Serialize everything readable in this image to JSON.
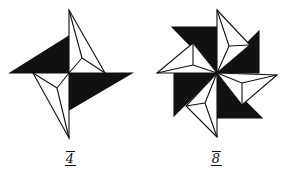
{
  "figures": [
    {
      "id": "fig-4",
      "label": "4",
      "description": "Fourfold pinwheel star: two black triangles and two white kite-shaped points",
      "fill_color": "#111111",
      "stroke_color": "#111111"
    },
    {
      "id": "fig-8",
      "label": "8",
      "description": "Eightfold pinwheel star: four black triangles and four white kite-shaped points",
      "fill_color": "#111111",
      "stroke_color": "#111111"
    }
  ]
}
